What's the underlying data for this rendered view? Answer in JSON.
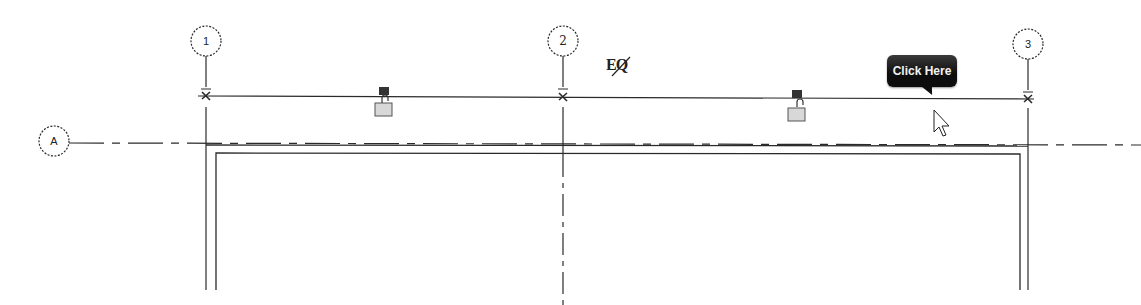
{
  "view": {
    "type": "floor-plan",
    "background": "#ffffff",
    "line_color": "#2a2a2a"
  },
  "grids": {
    "vertical": [
      {
        "label": "1",
        "x": 206
      },
      {
        "label": "2",
        "x": 563
      },
      {
        "label": "3",
        "x": 1028
      }
    ],
    "horizontal": [
      {
        "label": "A",
        "y": 145
      }
    ]
  },
  "dimension": {
    "eq_toggle_label": "EQ",
    "eq_state": "off",
    "constraint_locks": [
      {
        "name": "lock-left",
        "state": "unlocked"
      },
      {
        "name": "lock-right",
        "state": "unlocked"
      }
    ]
  },
  "tooltip": {
    "label": "Click Here"
  },
  "cursor": {
    "type": "arrow"
  }
}
